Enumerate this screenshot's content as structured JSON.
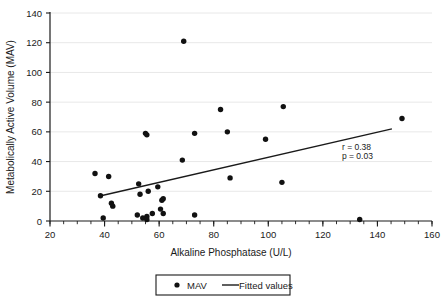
{
  "chart_data": {
    "type": "scatter",
    "title": "",
    "xlabel": "Alkaline Phosphatase  (U/L)",
    "ylabel": "Metabolically Active Volume (MAV)",
    "xlim": [
      20,
      160
    ],
    "ylim": [
      0,
      140
    ],
    "xticks": [
      20,
      40,
      60,
      80,
      100,
      120,
      140,
      160
    ],
    "xtick_labels": [
      "20",
      "40",
      "60",
      "80",
      "100",
      "120",
      "140",
      "160"
    ],
    "yticks": [
      0,
      20,
      40,
      60,
      80,
      100,
      120,
      140
    ],
    "ytick_labels": [
      "0",
      "20",
      "40",
      "60",
      "80",
      "100",
      "120",
      "140"
    ],
    "x_minor_tick_interval": 5,
    "grid": "horizontal",
    "legend_position": "bottom-center",
    "series": [
      {
        "name": "MAV",
        "type": "scatter",
        "marker": "circle",
        "color": "#111111",
        "points": [
          [
            36.5,
            32
          ],
          [
            38.5,
            17
          ],
          [
            39.5,
            2
          ],
          [
            41.5,
            30
          ],
          [
            42.5,
            12
          ],
          [
            43.0,
            10
          ],
          [
            52.0,
            4
          ],
          [
            52.5,
            25
          ],
          [
            53.0,
            18
          ],
          [
            54.0,
            2
          ],
          [
            55.0,
            59
          ],
          [
            55.5,
            58
          ],
          [
            55.5,
            3
          ],
          [
            55.5,
            1
          ],
          [
            56.0,
            20
          ],
          [
            57.5,
            5
          ],
          [
            59.5,
            23
          ],
          [
            60.5,
            8
          ],
          [
            61.0,
            14
          ],
          [
            61.5,
            15
          ],
          [
            61.5,
            5
          ],
          [
            68.5,
            41
          ],
          [
            69.0,
            121
          ],
          [
            73.0,
            4
          ],
          [
            73.0,
            59
          ],
          [
            82.5,
            75
          ],
          [
            85.0,
            60
          ],
          [
            86.0,
            29
          ],
          [
            99.0,
            55
          ],
          [
            105.5,
            77
          ],
          [
            105.0,
            26
          ],
          [
            133.5,
            1
          ],
          [
            149.0,
            69
          ]
        ]
      },
      {
        "name": "Fitted values",
        "type": "line",
        "color": "#1a1a1a",
        "endpoints": [
          [
            38.7,
            17
          ],
          [
            145.3,
            62
          ]
        ]
      }
    ],
    "annotations": [
      {
        "text": "r = 0.38",
        "x": 127,
        "y": 48
      },
      {
        "text": "p = 0.03",
        "x": 127,
        "y": 42
      }
    ]
  },
  "legend": {
    "entries": [
      {
        "label": "MAV",
        "marker": "circle-marker"
      },
      {
        "label": "Fitted values",
        "marker": "line-marker"
      }
    ]
  },
  "axes": {
    "x_title": "Alkaline Phosphatase  (U/L)",
    "y_title": "Metabolically Active Volume (MAV)"
  },
  "stats": {
    "r_label": "r = 0.38",
    "p_label": "p = 0.03"
  },
  "colors": {
    "marker": "#111111",
    "line": "#1a1a1a",
    "grid": "#e8e8e8",
    "axis": "#1a1a1a",
    "background": "#ffffff"
  }
}
